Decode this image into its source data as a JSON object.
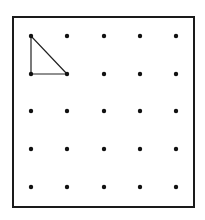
{
  "diagram": {
    "type": "dot-grid",
    "rows": 5,
    "cols": 5,
    "frame": {
      "x": 13,
      "y": 17,
      "width": 181,
      "height": 190,
      "stroke": "#1a1a1a",
      "stroke_width": 2
    },
    "col_x": [
      31,
      67,
      104,
      140,
      176
    ],
    "row_y": [
      36,
      74,
      111,
      149,
      187
    ],
    "dot_radius": 2.2,
    "dot_color": "#111111",
    "shapes": [
      {
        "name": "right-triangle",
        "vertices": [
          [
            0,
            0
          ],
          [
            0,
            1
          ],
          [
            1,
            1
          ]
        ],
        "vertex_grid_refs": [
          "row1-col2",
          "row2-col1",
          "row2-col2"
        ],
        "stroke": "#222222",
        "stroke_width": 1.2
      }
    ]
  }
}
